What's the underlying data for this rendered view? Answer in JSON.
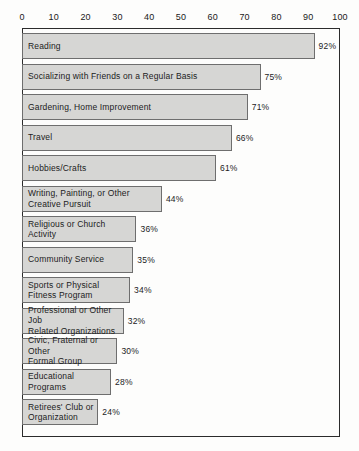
{
  "chart_data": {
    "type": "bar",
    "orientation": "horizontal",
    "title": "",
    "xlabel": "",
    "ylabel": "",
    "xlim": [
      0,
      100
    ],
    "grid": false,
    "legend": null,
    "axis_position": "top",
    "tick_labels": [
      "0",
      "10",
      "20",
      "30",
      "40",
      "50",
      "60",
      "70",
      "80",
      "90",
      "100"
    ],
    "ticks": [
      0,
      10,
      20,
      30,
      40,
      50,
      60,
      70,
      80,
      90,
      100
    ],
    "categories": [
      "Reading",
      "Socializing with Friends on a Regular Basis",
      "Gardening, Home Improvement",
      "Travel",
      "Hobbies/Crafts",
      "Writing, Painting, or Other\nCreative Pursuit",
      "Religious or Church\nActivity",
      "Community Service",
      "Sports or Physical\nFitness Program",
      "Professional or Other Job\nRelated Organizations",
      "Civic, Fraternal or Other\nFormal Group",
      "Educational\nPrograms",
      "Retirees' Club or\nOrganization"
    ],
    "values": [
      92,
      75,
      71,
      66,
      61,
      44,
      36,
      35,
      34,
      32,
      30,
      28,
      24
    ],
    "value_labels": [
      "92%",
      "75%",
      "71%",
      "66%",
      "61%",
      "44%",
      "36%",
      "35%",
      "34%",
      "32%",
      "30%",
      "28%",
      "24%"
    ],
    "colors": {
      "bar_fill": "#d6d6d4",
      "bar_border": "#6e6e6e",
      "frame": "#2b2b2b",
      "text": "#1c1c1c",
      "background": "#fdfdfc"
    }
  }
}
